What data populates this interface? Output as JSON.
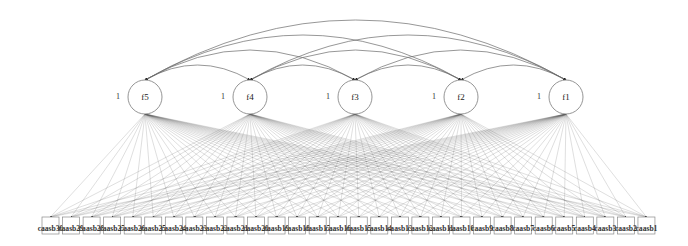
{
  "diagram": {
    "type": "confirmatory factor analysis path diagram",
    "factors": [
      {
        "id": "f5",
        "label": "f5",
        "variance_label": "1",
        "cx": 145,
        "cy": 97
      },
      {
        "id": "f4",
        "label": "f4",
        "variance_label": "1",
        "cx": 250,
        "cy": 97
      },
      {
        "id": "f3",
        "label": "f3",
        "variance_label": "1",
        "cx": 355,
        "cy": 97
      },
      {
        "id": "f2",
        "label": "f2",
        "variance_label": "1",
        "cx": 461,
        "cy": 97
      },
      {
        "id": "f1",
        "label": "f1",
        "variance_label": "1",
        "cx": 566,
        "cy": 97
      }
    ],
    "factor_radius": 17,
    "indicators": [
      "caasb30",
      "caasb29",
      "caasb28",
      "caasb27",
      "caasb26",
      "caasb25",
      "caasb24",
      "caasb23",
      "caasb22",
      "caasb21",
      "caasb20",
      "caasb19",
      "caasb18",
      "caasb17",
      "caasb16",
      "caasb15",
      "caasb14",
      "caasb13",
      "caasb12",
      "caasb11",
      "caasb10",
      "caasb9",
      "caasb8",
      "caasb7",
      "caasb6",
      "caasb5",
      "caasb4",
      "caasb3",
      "caasb2",
      "caasb1"
    ],
    "indicator_box": {
      "x0": 42,
      "pitch": 20.55,
      "width": 17,
      "top": 217,
      "height": 17
    },
    "covariances": [
      [
        "f5",
        "f4"
      ],
      [
        "f5",
        "f3"
      ],
      [
        "f5",
        "f2"
      ],
      [
        "f5",
        "f1"
      ],
      [
        "f4",
        "f3"
      ],
      [
        "f4",
        "f2"
      ],
      [
        "f4",
        "f1"
      ],
      [
        "f3",
        "f2"
      ],
      [
        "f3",
        "f1"
      ],
      [
        "f2",
        "f1"
      ]
    ],
    "loadings": "every factor to every indicator",
    "colors": {
      "line": "#555555",
      "box_stroke": "#8a8a8a",
      "circle_stroke": "#7a7a7a",
      "background": "#ffffff"
    }
  }
}
